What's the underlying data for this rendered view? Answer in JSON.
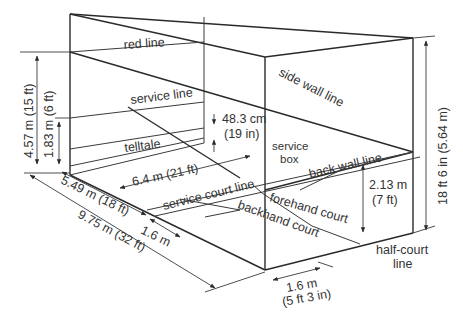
{
  "diagram": {
    "colors": {
      "line": "#2a2a2a",
      "text": "#333333",
      "background": "#ffffff"
    },
    "labels": {
      "red_line": "red line",
      "service_line": "service line",
      "telltale": "telltale",
      "side_wall_line": "side wall line",
      "back_wall_line": "back wall line",
      "service_box_1": "service",
      "service_box_2": "box",
      "service_court_line": "service court line",
      "forehand_court": "forehand court",
      "backhand_court": "backhand court",
      "half_court_line_1": "half-court",
      "half_court_line_2": "line"
    },
    "dimensions": {
      "front_wall_height": "4.57 m (15 ft)",
      "service_line_height": "1.83 m (6 ft)",
      "telltale_height_cm": "48.3 cm",
      "telltale_height_in": "(19 in)",
      "short_line_distance": "6.4 m (21 ft)",
      "service_court_depth": "5.49 m (18 ft)",
      "service_box_depth": "1.6 m",
      "court_length": "9.75 m  (32 ft)",
      "back_wall_height_m": "2.13 m",
      "back_wall_height_ft": "(7 ft)",
      "side_height": "18 ft 6 in (5.64 m)",
      "service_box_width_m": "1.6 m",
      "service_box_width_ft": "(5 ft 3 in)"
    }
  }
}
